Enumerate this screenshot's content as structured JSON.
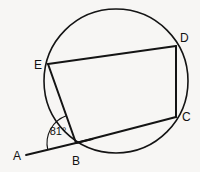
{
  "figure": {
    "background_color": "#f7f6f4",
    "stroke_color": "#141414",
    "label_color": "#111111"
  },
  "circle": {
    "cx": 116,
    "cy": 81,
    "r": 72
  },
  "points": {
    "A": {
      "x": 26,
      "y": 155,
      "label": "A",
      "label_x": 13,
      "label_y": 160,
      "on_circle": false
    },
    "B": {
      "x": 76,
      "y": 143,
      "label": "B",
      "label_x": 72,
      "label_y": 165,
      "on_circle": true
    },
    "C": {
      "x": 176,
      "y": 117,
      "label": "C",
      "label_x": 182,
      "label_y": 121,
      "on_circle": true
    },
    "D": {
      "x": 176,
      "y": 46,
      "label": "D",
      "label_x": 180,
      "label_y": 42,
      "on_circle": true
    },
    "E": {
      "x": 48,
      "y": 64,
      "label": "E",
      "label_x": 34,
      "label_y": 69,
      "on_circle": true
    }
  },
  "segments": [
    {
      "name": "segment-ab",
      "from": "A",
      "to": "B",
      "kind": "ray"
    },
    {
      "name": "segment-be",
      "from": "B",
      "to": "E",
      "kind": "chord"
    },
    {
      "name": "segment-ed",
      "from": "E",
      "to": "D",
      "kind": "chord"
    },
    {
      "name": "segment-dc",
      "from": "D",
      "to": "C",
      "kind": "chord"
    },
    {
      "name": "segment-cb",
      "from": "C",
      "to": "B",
      "kind": "chord"
    }
  ],
  "angle": {
    "vertex": "B",
    "value": "81°",
    "value_number": 81,
    "unit": "degrees",
    "label_x": 58,
    "label_y": 135,
    "arc_radius": 29,
    "between": [
      "BA",
      "BE"
    ]
  }
}
